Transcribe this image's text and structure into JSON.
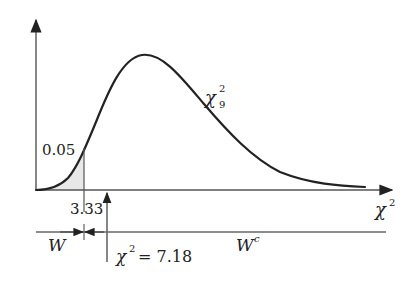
{
  "diagram": {
    "type": "chi-square rejection region diagram",
    "distribution_label": {
      "symbol": "χ",
      "superscript": "2",
      "subscript": "9"
    },
    "x_axis_label": {
      "symbol": "χ",
      "superscript": "2"
    },
    "area_label": "0.05",
    "critical_value_label": "3.33",
    "test_statistic_label": {
      "symbol": "χ",
      "superscript": "2",
      "equals": "= 7.18"
    },
    "rejection_region_label": "W",
    "acceptance_region_label": {
      "base": "W",
      "superscript": "c"
    },
    "colors": {
      "curve": "#222222",
      "axis": "#333333",
      "shaded_area": "#e8e8e8"
    }
  }
}
